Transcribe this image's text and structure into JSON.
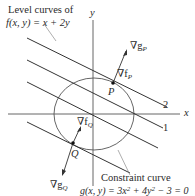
{
  "diagram": {
    "title_line1": "Level curves of",
    "title_line2": "f(x, y) = x + 2y",
    "axis_x_label": "x",
    "axis_y_label": "y",
    "level_labels": [
      "2",
      "1"
    ],
    "point_P": "P",
    "point_Q": "Q",
    "grad_g_P": "∇g",
    "grad_g_P_sub": "P",
    "grad_f_P": "∇f",
    "grad_f_P_sub": "P",
    "grad_f_Q": "∇f",
    "grad_f_Q_sub": "Q",
    "grad_g_Q": "∇g",
    "grad_g_Q_sub": "Q",
    "constraint_line1": "Constraint curve",
    "constraint_line2_prefix": "g(x, y) = 3x",
    "constraint_sup1": "2",
    "constraint_mid": " + 4y",
    "constraint_sup2": "2",
    "constraint_suffix": " − 3 = 0",
    "colors": {
      "ink": "#2a2a2a",
      "axis": "#555555"
    }
  }
}
